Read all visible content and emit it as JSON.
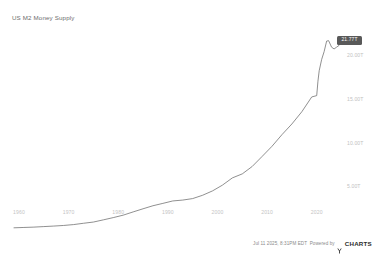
{
  "chart_title": "US M2 Money Supply",
  "value_badge": {
    "label": "21.77T"
  },
  "footer": {
    "timestamp": "Jul 11 2025, 8:31PM EDT",
    "powered_by": "Powered by",
    "brand": "CHARTS",
    "brand_mark": "y-logo-icon"
  },
  "chart_data": {
    "type": "line",
    "title": "US M2 Money Supply",
    "xlabel": "",
    "ylabel": "",
    "grid": false,
    "legend": false,
    "line_color": "#6b6b6b",
    "background": "#ffffff",
    "y_axis_side": "right",
    "ylim": [
      2.8,
      23.2
    ],
    "xlim": [
      1959,
      2025.5
    ],
    "y_ticks": [
      20.0,
      15.0,
      10.0,
      5.0
    ],
    "y_tick_labels": [
      "20.00T",
      "15.00T",
      "10.00T",
      "5.00T"
    ],
    "x_ticks": [
      1960,
      1970,
      1980,
      1990,
      2000,
      2010,
      2020
    ],
    "x_tick_labels": [
      "1960",
      "1970",
      "1980",
      "1990",
      "2000",
      "2010",
      "2020"
    ],
    "last_value": 21.77,
    "last_value_label": "21.77T",
    "series": [
      {
        "name": "US M2 Money Supply",
        "units": "USD trillions",
        "x": [
          1959,
          1961,
          1963,
          1965,
          1967,
          1969,
          1971,
          1973,
          1975,
          1977,
          1979,
          1981,
          1983,
          1985,
          1987,
          1989,
          1991,
          1993,
          1995,
          1997,
          1999,
          2001,
          2003,
          2005,
          2007,
          2009,
          2011,
          2013,
          2015,
          2017,
          2019,
          2020.0,
          2020.25,
          2020.5,
          2021,
          2021.5,
          2022,
          2022.4,
          2023,
          2023.5,
          2024,
          2024.5,
          2025,
          2025.5
        ],
        "values": [
          0.3,
          0.34,
          0.38,
          0.44,
          0.5,
          0.57,
          0.67,
          0.82,
          0.96,
          1.21,
          1.47,
          1.75,
          2.12,
          2.48,
          2.83,
          3.1,
          3.38,
          3.48,
          3.65,
          4.03,
          4.53,
          5.19,
          6.02,
          6.48,
          7.33,
          8.48,
          9.65,
          10.98,
          12.2,
          13.6,
          15.3,
          15.45,
          17.1,
          18.3,
          19.6,
          20.5,
          21.7,
          21.75,
          21.0,
          20.8,
          21.0,
          21.2,
          21.6,
          21.77
        ]
      }
    ],
    "annotations": [
      {
        "type": "last-value-badge",
        "text": "21.77T",
        "background": "#595959",
        "text_color": "#ffffff"
      }
    ]
  }
}
